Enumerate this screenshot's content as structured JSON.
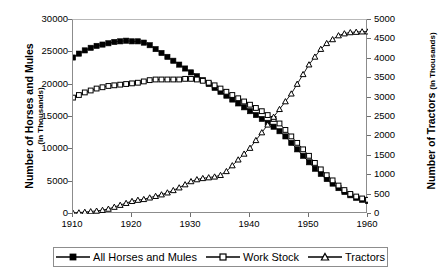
{
  "axes": {
    "y_left": {
      "title_main": "Number of Horses and Mules",
      "title_sub": "(In Thousands)",
      "ticks": [
        "0",
        "5000",
        "10000",
        "15000",
        "20000",
        "25000",
        "30000"
      ],
      "min": 0,
      "max": 30000
    },
    "y_right": {
      "title_main": "Number of Tractors",
      "title_sub": "(In Thousands)",
      "ticks": [
        "0",
        "500",
        "1000",
        "1500",
        "2000",
        "2500",
        "3000",
        "3500",
        "4000",
        "4500",
        "5000"
      ],
      "min": 0,
      "max": 5000
    },
    "x": {
      "ticks": [
        "1910",
        "1920",
        "1930",
        "1940",
        "1950",
        "1960"
      ],
      "min": 1910,
      "max": 1960
    }
  },
  "legend": {
    "items": [
      {
        "label": "All Horses and Mules",
        "marker": "filled-square",
        "color": "#000000"
      },
      {
        "label": "Work Stock",
        "marker": "open-square",
        "color": "#000000"
      },
      {
        "label": "Tractors",
        "marker": "open-triangle",
        "color": "#000000"
      }
    ]
  },
  "chart_data": {
    "type": "line",
    "title": "",
    "subtitle": "",
    "xlabel": "",
    "ylabel": "Number of Horses and Mules (In Thousands)",
    "ylabel_secondary": "Number of Tractors (In Thousands)",
    "xlim": [
      1910,
      1960
    ],
    "ylim": [
      0,
      30000
    ],
    "ylim_secondary": [
      0,
      5000
    ],
    "grid": false,
    "legend_position": "bottom",
    "x": [
      1910,
      1911,
      1912,
      1913,
      1914,
      1915,
      1916,
      1917,
      1918,
      1919,
      1920,
      1921,
      1922,
      1923,
      1924,
      1925,
      1926,
      1927,
      1928,
      1929,
      1930,
      1931,
      1932,
      1933,
      1934,
      1935,
      1936,
      1937,
      1938,
      1939,
      1940,
      1941,
      1942,
      1943,
      1944,
      1945,
      1946,
      1947,
      1948,
      1949,
      1950,
      1951,
      1952,
      1953,
      1954,
      1955,
      1956,
      1957,
      1958,
      1959,
      1960
    ],
    "series": [
      {
        "name": "All Horses and Mules",
        "axis": "left",
        "marker": "filled-square",
        "values": [
          24200,
          24800,
          25300,
          25700,
          26000,
          26200,
          26400,
          26600,
          26700,
          26800,
          26700,
          26700,
          26500,
          26100,
          25500,
          24900,
          24300,
          23700,
          23100,
          22500,
          21900,
          21300,
          20700,
          20100,
          19500,
          18900,
          18300,
          17700,
          17100,
          16500,
          15900,
          15300,
          14700,
          14100,
          13500,
          12800,
          12000,
          11000,
          10000,
          9000,
          8000,
          7000,
          6200,
          5400,
          4700,
          4000,
          3400,
          2900,
          2500,
          2200,
          2000
        ]
      },
      {
        "name": "Work Stock",
        "axis": "left",
        "marker": "open-square",
        "values": [
          18000,
          18400,
          18800,
          19100,
          19400,
          19600,
          19800,
          19900,
          20000,
          20100,
          20200,
          20300,
          20500,
          20700,
          20800,
          20800,
          20800,
          20800,
          20800,
          20900,
          20900,
          20800,
          20600,
          20300,
          19900,
          19400,
          18900,
          18400,
          17900,
          17400,
          16900,
          16400,
          15900,
          15300,
          14700,
          14000,
          13000,
          12000,
          11000,
          10000,
          9000,
          7900,
          6900,
          6000,
          5200,
          4400,
          3700,
          3100,
          2700,
          2400,
          2200
        ]
      },
      {
        "name": "Tractors",
        "axis": "right",
        "marker": "open-triangle",
        "values": [
          25,
          35,
          50,
          65,
          80,
          100,
          130,
          180,
          230,
          280,
          330,
          360,
          380,
          420,
          460,
          500,
          550,
          610,
          680,
          760,
          840,
          890,
          920,
          940,
          960,
          1000,
          1100,
          1250,
          1400,
          1550,
          1700,
          1900,
          2100,
          2300,
          2500,
          2700,
          2900,
          3100,
          3350,
          3600,
          3850,
          4050,
          4250,
          4400,
          4500,
          4600,
          4650,
          4680,
          4690,
          4700,
          4700
        ]
      }
    ]
  }
}
